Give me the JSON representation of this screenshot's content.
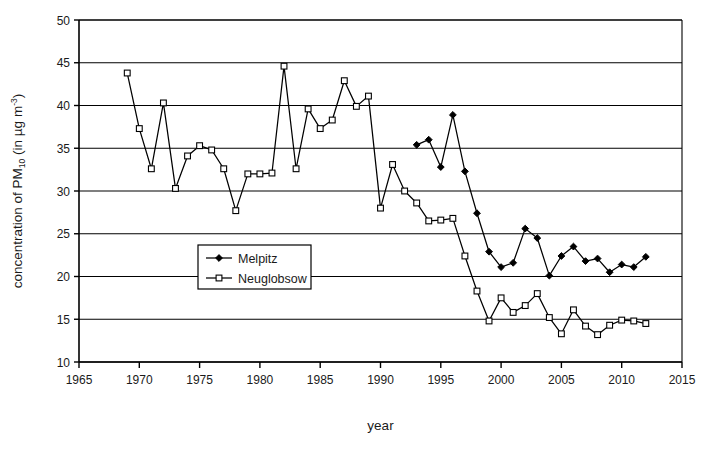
{
  "chart": {
    "type": "line",
    "y_axis_title_parts": {
      "pre": "concentration of PM",
      "sub": "10",
      "mid": " (in ",
      "unit": "µg m",
      "sup": "-3",
      "post": ")"
    },
    "y_axis_title_full": "concentration of PM10 (in µg m-3)",
    "x_axis_title": "year",
    "legend": {
      "items": [
        {
          "label": "Melpitz",
          "marker": "filled-diamond",
          "color": "#000000"
        },
        {
          "label": "Neuglobsow",
          "marker": "open-square",
          "color": "#000000"
        }
      ]
    }
  },
  "chart_data": {
    "type": "line",
    "title": "",
    "xlabel": "year",
    "ylabel": "concentration of PM10 (in µg m-3)",
    "xlim": [
      1965,
      2015
    ],
    "ylim": [
      10,
      50
    ],
    "xticks": [
      1965,
      1970,
      1975,
      1980,
      1985,
      1990,
      1995,
      2000,
      2005,
      2010,
      2015
    ],
    "yticks": [
      10,
      15,
      20,
      25,
      30,
      35,
      40,
      45,
      50
    ],
    "grid": "horizontal",
    "legend_position": "center-left",
    "series": [
      {
        "name": "Melpitz",
        "marker": "filled-diamond",
        "color": "#000000",
        "x": [
          1993,
          1994,
          1995,
          1996,
          1997,
          1998,
          1999,
          2000,
          2001,
          2002,
          2003,
          2004,
          2005,
          2006,
          2007,
          2008,
          2009,
          2010,
          2011,
          2012
        ],
        "values": [
          35.4,
          36.0,
          32.8,
          38.9,
          32.3,
          27.4,
          22.9,
          21.1,
          21.6,
          25.6,
          24.5,
          20.1,
          22.4,
          23.5,
          21.8,
          22.1,
          20.5,
          21.4,
          21.1,
          22.3
        ]
      },
      {
        "name": "Neuglobsow",
        "marker": "open-square",
        "color": "#000000",
        "x": [
          1969,
          1970,
          1971,
          1972,
          1973,
          1974,
          1975,
          1976,
          1977,
          1978,
          1979,
          1980,
          1981,
          1982,
          1983,
          1984,
          1985,
          1986,
          1987,
          1988,
          1989,
          1990,
          1991,
          1992,
          1993,
          1994,
          1995,
          1996,
          1997,
          1998,
          1999,
          2000,
          2001,
          2002,
          2003,
          2004,
          2005,
          2006,
          2007,
          2008,
          2009,
          2010,
          2011,
          2012
        ],
        "values": [
          43.8,
          37.3,
          32.6,
          40.3,
          30.3,
          34.1,
          35.3,
          34.8,
          32.6,
          27.7,
          32.0,
          32.0,
          32.1,
          44.6,
          32.6,
          39.6,
          37.3,
          38.3,
          42.9,
          39.9,
          41.1,
          28.0,
          33.1,
          30.0,
          28.6,
          26.5,
          26.6,
          26.8,
          22.4,
          18.3,
          14.8,
          17.5,
          15.8,
          16.6,
          18.0,
          15.2,
          13.3,
          16.1,
          14.2,
          13.2,
          14.3,
          14.9,
          14.8,
          14.5
        ]
      }
    ]
  }
}
